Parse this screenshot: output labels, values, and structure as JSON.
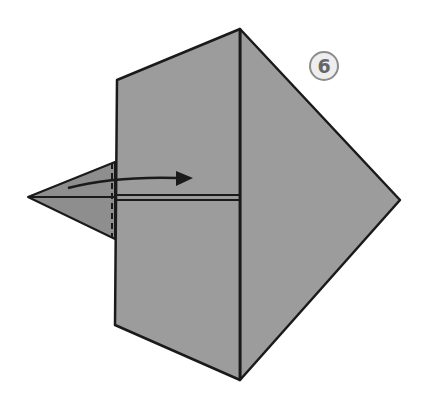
{
  "diagram": {
    "type": "origami-fold-step",
    "step_number": "6",
    "instruction": "Fold the left triangular flap to the right along the dashed line",
    "colors": {
      "paper": "#9c9c9c",
      "flap": "#8e8e8e",
      "line": "#1a1a1a",
      "badge_border": "#8c8c8c",
      "badge_fill": "#eeeeee",
      "badge_text": "#666666"
    },
    "shapes": {
      "square_front": [
        [
          117,
          80
        ],
        [
          240,
          29
        ],
        [
          240,
          380
        ],
        [
          115,
          325
        ]
      ],
      "right_face": [
        [
          240,
          29
        ],
        [
          400,
          200
        ],
        [
          240,
          380
        ]
      ],
      "left_flap": [
        [
          28,
          197
        ],
        [
          112,
          163
        ],
        [
          112,
          238
        ]
      ],
      "center_crease_y": 197,
      "dashed_fold_x": 112,
      "arrow": {
        "start": [
          68,
          188
        ],
        "end": [
          192,
          178
        ]
      }
    }
  }
}
